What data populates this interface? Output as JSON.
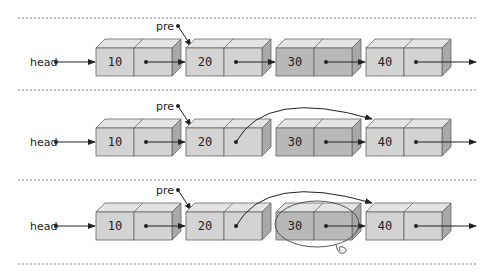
{
  "diagram": {
    "head_label": "head",
    "pre_label": "pre",
    "rows": [
      {
        "step": 1,
        "nodes": [
          "10",
          "20",
          "30",
          "40"
        ],
        "pre_points_to": "20",
        "bypass_link": false,
        "removed_circled": false
      },
      {
        "step": 2,
        "nodes": [
          "10",
          "20",
          "30",
          "40"
        ],
        "pre_points_to": "20",
        "bypass_link": true,
        "removed_circled": false
      },
      {
        "step": 3,
        "nodes": [
          "10",
          "20",
          "30",
          "40"
        ],
        "pre_points_to": "20",
        "bypass_link": true,
        "removed_circled": true
      }
    ]
  },
  "colors": {
    "node_face": "#d3d3d3",
    "node_face_removed": "#b8b8b8",
    "node_top": "#e4e4e4",
    "node_side": "#a8a8a8",
    "stroke": "#666666",
    "arrow": "#222222",
    "separator": "#888888"
  }
}
